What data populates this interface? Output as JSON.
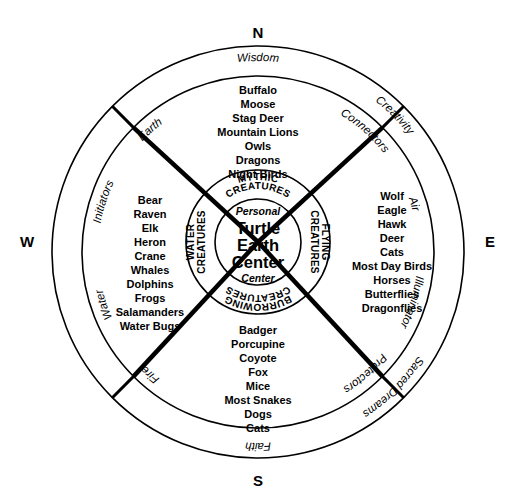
{
  "diagram": {
    "compass": {
      "north": "N",
      "south": "S",
      "east": "E",
      "west": "W"
    },
    "outer_ring": {
      "top": "Wisdom",
      "bottom": "Faith",
      "left": "Sacred Dreams",
      "right": "Creativity"
    },
    "middle_ring": {
      "northwest": "Earth",
      "northeast": "Connectors",
      "west_upper": "Initiators",
      "east_upper": "Air",
      "west_lower": "Water",
      "east_lower": "Illuminator",
      "southwest": "Fire",
      "southeast": "Protectors"
    },
    "inner_ring": {
      "top": "MYTHIC CREATURES",
      "top_line1": "MYTHIC",
      "top_line2": "CREATURES",
      "right_line1": "FLYING",
      "right_line2": "CREATURES",
      "bottom_line1": "BURROWING",
      "bottom_line2": "CREATURES",
      "left_line1": "WATER",
      "left_line2": "CREATURES"
    },
    "center": {
      "top_label": "Personal",
      "line1": "Turtle",
      "line2": "Earth",
      "line3": "Center",
      "bottom_label": "Center"
    },
    "quadrants": {
      "north": {
        "name": "MYTHIC CREATURES",
        "animals": [
          "Buffalo",
          "Moose",
          "Stag Deer",
          "Mountain Lions",
          "Owls",
          "Dragons",
          "Night Birds"
        ]
      },
      "east": {
        "name": "FLYING CREATURES",
        "animals": [
          "Wolf",
          "Eagle",
          "Hawk",
          "Deer",
          "Cats",
          "Most Day Birds",
          "Horses",
          "Butterflies",
          "Dragonflies"
        ]
      },
      "south": {
        "name": "BURROWING CREATURES",
        "animals": [
          "Badger",
          "Porcupine",
          "Coyote",
          "Fox",
          "Mice",
          "Most Snakes",
          "Dogs",
          "Cats"
        ]
      },
      "west": {
        "name": "WATER CREATURES",
        "animals": [
          "Bear",
          "Raven",
          "Elk",
          "Heron",
          "Crane",
          "Whales",
          "Dolphins",
          "Frogs",
          "Salamanders",
          "Water Bugs"
        ]
      }
    },
    "colors": {
      "stroke": "#000000",
      "background": "#ffffff"
    }
  }
}
